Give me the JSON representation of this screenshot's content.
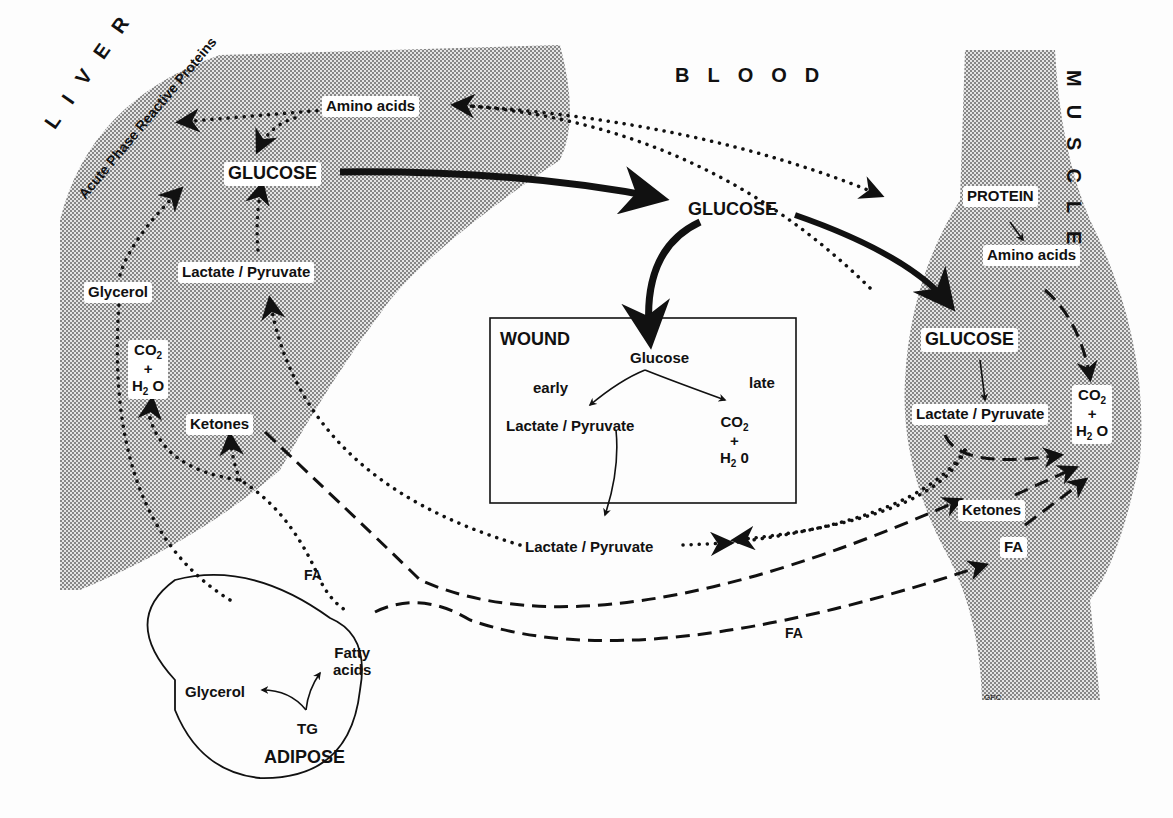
{
  "regions": {
    "liver": "LIVER",
    "blood": "BLOOD",
    "muscle": "MUSCLE",
    "wound": "WOUND",
    "adipose": "ADIPOSE"
  },
  "liver": {
    "acute_phase": "Acute Phase Reactive Proteins",
    "amino_acids": "Amino acids",
    "glucose": "GLUCOSE",
    "lactate_pyruvate": "Lactate / Pyruvate",
    "glycerol": "Glycerol",
    "co2": "CO",
    "plus": "+",
    "h2o": "H",
    "ketones": "Ketones"
  },
  "blood": {
    "glucose": "GLUCOSE",
    "lactate_pyruvate": "Lactate / Pyruvate",
    "fa_left": "FA",
    "fa_bottom": "FA"
  },
  "wound": {
    "glucose": "Glucose",
    "early": "early",
    "late": "late",
    "lactate_pyruvate": "Lactate / Pyruvate",
    "co2": "CO",
    "plus": "+",
    "h2o": "H"
  },
  "muscle": {
    "protein": "PROTEIN",
    "amino_acids": "Amino  acids",
    "glucose": "GLUCOSE",
    "lactate_pyruvate": "Lactate / Pyruvate",
    "co2": "CO",
    "plus": "+",
    "h2o": "H",
    "ketones": "Ketones",
    "fa": "FA"
  },
  "adipose": {
    "glycerol": "Glycerol",
    "fatty": "Fatty",
    "acids": "acids",
    "tg": "TG"
  },
  "signature": "GPC",
  "colors": {
    "ink": "#111111",
    "shade": "#b8b8b8",
    "paper": "#fdfdfd"
  }
}
